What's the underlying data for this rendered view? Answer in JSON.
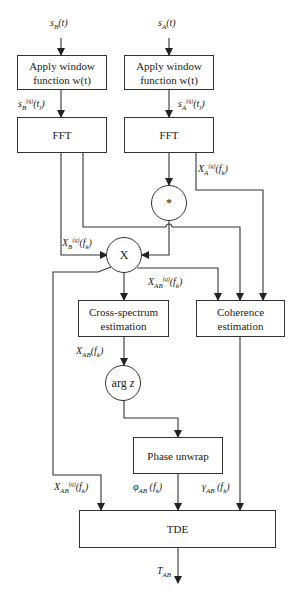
{
  "inputs": {
    "sB": "s_B(t)",
    "sA": "s_A(t)"
  },
  "blocks": {
    "window_left": "Apply window function w(t)",
    "window_right": "Apply window function w(t)",
    "fft_left": "FFT",
    "fft_right": "FFT",
    "conj": "*",
    "multiply": "X",
    "cross_spectrum": "Cross-spectrum estimation",
    "coherence": "Coherence estimation",
    "arg": "arg z",
    "phase_unwrap": "Phase unwrap",
    "tde": "TDE"
  },
  "labels": {
    "sB_windowed": "s_B^(q)(t_l)",
    "sA_windowed": "s_A^(q)(t_l)",
    "XA": "X_A^(q)(f_k)",
    "XB": "X_B^(q)(f_k)",
    "XAB_q": "X_AB^(q)(f_k)",
    "XAB": "X_AB(f_k)",
    "XAB_q_tde": "X_AB^(q)(f_k)",
    "phi": "φ_AB(f_k)",
    "gamma": "γ_AB(f_k)",
    "output": "T_AB"
  }
}
